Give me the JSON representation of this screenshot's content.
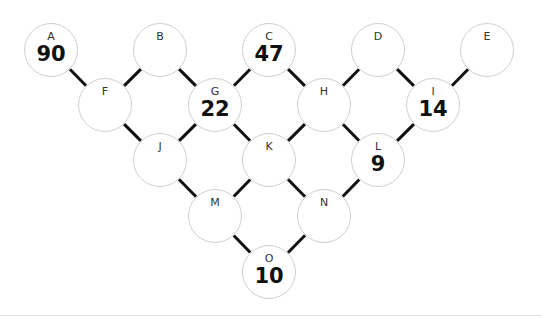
{
  "diagram": {
    "nodes": [
      {
        "id": "A",
        "value": "90",
        "x": 51,
        "y": 50
      },
      {
        "id": "B",
        "value": "",
        "x": 160,
        "y": 50
      },
      {
        "id": "C",
        "value": "47",
        "x": 269,
        "y": 50
      },
      {
        "id": "D",
        "value": "",
        "x": 378,
        "y": 50
      },
      {
        "id": "E",
        "value": "",
        "x": 487,
        "y": 50
      },
      {
        "id": "F",
        "value": "",
        "x": 105,
        "y": 105
      },
      {
        "id": "G",
        "value": "22",
        "x": 215,
        "y": 105
      },
      {
        "id": "H",
        "value": "",
        "x": 324,
        "y": 105
      },
      {
        "id": "I",
        "value": "14",
        "x": 433,
        "y": 105
      },
      {
        "id": "J",
        "value": "",
        "x": 160,
        "y": 160
      },
      {
        "id": "K",
        "value": "",
        "x": 269,
        "y": 160
      },
      {
        "id": "L",
        "value": "9",
        "x": 378,
        "y": 160
      },
      {
        "id": "M",
        "value": "",
        "x": 215,
        "y": 216
      },
      {
        "id": "N",
        "value": "",
        "x": 324,
        "y": 216
      },
      {
        "id": "O",
        "value": "10",
        "x": 269,
        "y": 272
      }
    ],
    "edges": [
      [
        "A",
        "F"
      ],
      [
        "B",
        "F"
      ],
      [
        "B",
        "G"
      ],
      [
        "C",
        "G"
      ],
      [
        "C",
        "H"
      ],
      [
        "D",
        "H"
      ],
      [
        "D",
        "I"
      ],
      [
        "E",
        "I"
      ],
      [
        "F",
        "J"
      ],
      [
        "G",
        "J"
      ],
      [
        "G",
        "K"
      ],
      [
        "H",
        "K"
      ],
      [
        "H",
        "L"
      ],
      [
        "I",
        "L"
      ],
      [
        "J",
        "M"
      ],
      [
        "K",
        "M"
      ],
      [
        "K",
        "N"
      ],
      [
        "L",
        "N"
      ],
      [
        "M",
        "O"
      ],
      [
        "N",
        "O"
      ]
    ]
  }
}
